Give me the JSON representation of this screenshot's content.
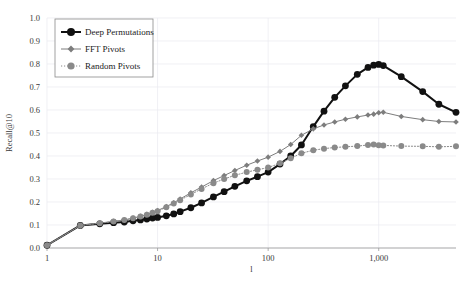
{
  "chart_data": {
    "type": "line",
    "title": "",
    "xlabel": "l",
    "ylabel": "Recall@10",
    "xscale": "log",
    "xlim": [
      1,
      5000
    ],
    "ylim": [
      0.0,
      1.0
    ],
    "grid": true,
    "legend_position": "top-left",
    "ytick_labels": [
      "0.0",
      "0.1",
      "0.2",
      "0.3",
      "0.4",
      "0.5",
      "0.6",
      "0.7",
      "0.8",
      "0.9",
      "1.0"
    ],
    "ytick_values": [
      0.0,
      0.1,
      0.2,
      0.3,
      0.4,
      0.5,
      0.6,
      0.7,
      0.8,
      0.9,
      1.0
    ],
    "xtick_labels": [
      "1",
      "10",
      "100",
      "1,000"
    ],
    "xtick_values": [
      1,
      10,
      100,
      1000
    ],
    "series": [
      {
        "name": "Deep Permutations",
        "color": "#111111",
        "line_style": "solid",
        "line_width": 2.0,
        "marker": "circle",
        "marker_size": 3.4,
        "x": [
          1,
          2,
          3,
          4,
          5,
          6,
          7,
          8,
          9,
          10,
          12,
          14,
          16,
          20,
          25,
          32,
          40,
          50,
          64,
          80,
          100,
          128,
          160,
          200,
          256,
          320,
          400,
          500,
          640,
          800,
          900,
          1000,
          1100,
          1600,
          2500,
          3500,
          5000
        ],
        "y": [
          0.012,
          0.098,
          0.105,
          0.11,
          0.113,
          0.118,
          0.122,
          0.126,
          0.13,
          0.133,
          0.14,
          0.148,
          0.158,
          0.175,
          0.196,
          0.222,
          0.245,
          0.268,
          0.292,
          0.31,
          0.33,
          0.365,
          0.4,
          0.448,
          0.528,
          0.595,
          0.655,
          0.705,
          0.755,
          0.785,
          0.795,
          0.798,
          0.793,
          0.745,
          0.68,
          0.625,
          0.59
        ]
      },
      {
        "name": "FFT Pivots",
        "color": "#7d7d7d",
        "line_style": "solid",
        "line_width": 1.0,
        "marker": "diamond",
        "marker_size": 2.8,
        "x": [
          1,
          2,
          3,
          4,
          5,
          6,
          7,
          8,
          9,
          10,
          12,
          14,
          16,
          20,
          25,
          32,
          40,
          50,
          64,
          80,
          100,
          128,
          160,
          200,
          256,
          320,
          400,
          500,
          640,
          800,
          900,
          1000,
          1100,
          1600,
          2500,
          3500,
          5000
        ],
        "y": [
          0.012,
          0.098,
          0.108,
          0.116,
          0.122,
          0.13,
          0.138,
          0.146,
          0.155,
          0.163,
          0.18,
          0.197,
          0.213,
          0.24,
          0.265,
          0.293,
          0.315,
          0.337,
          0.36,
          0.378,
          0.395,
          0.42,
          0.45,
          0.49,
          0.518,
          0.535,
          0.548,
          0.56,
          0.57,
          0.578,
          0.582,
          0.588,
          0.59,
          0.572,
          0.558,
          0.55,
          0.548
        ]
      },
      {
        "name": "Random Pivots",
        "color": "#8a8a8a",
        "line_style": "dotted",
        "line_width": 1.0,
        "marker": "circle",
        "marker_size": 3.0,
        "x": [
          1,
          2,
          3,
          4,
          5,
          6,
          7,
          8,
          9,
          10,
          12,
          14,
          16,
          20,
          25,
          32,
          40,
          50,
          64,
          80,
          100,
          128,
          160,
          200,
          256,
          320,
          400,
          500,
          640,
          800,
          900,
          1000,
          1100,
          1600,
          2500,
          3500,
          5000
        ],
        "y": [
          0.012,
          0.098,
          0.108,
          0.115,
          0.122,
          0.129,
          0.137,
          0.145,
          0.153,
          0.16,
          0.177,
          0.193,
          0.208,
          0.233,
          0.257,
          0.282,
          0.3,
          0.316,
          0.33,
          0.34,
          0.35,
          0.368,
          0.39,
          0.412,
          0.425,
          0.432,
          0.437,
          0.44,
          0.443,
          0.448,
          0.45,
          0.447,
          0.446,
          0.443,
          0.442,
          0.44,
          0.442
        ]
      }
    ]
  }
}
